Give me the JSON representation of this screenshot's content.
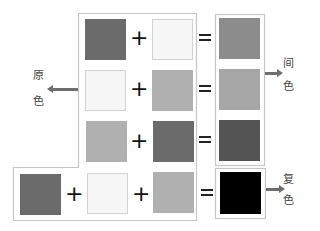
{
  "labels": {
    "primary": [
      "原",
      "色"
    ],
    "secondary": [
      "间",
      "色"
    ],
    "tertiary": [
      "复",
      "色"
    ]
  },
  "operators": {
    "plus": "+",
    "equals": "="
  },
  "colors": {
    "dark": "#6b6b6b",
    "white": "#f7f7f7",
    "mid": "#b0b0b0",
    "result_row1": "#8c8c8c",
    "result_row2": "#a6a6a6",
    "result_row3": "#545454",
    "result_bottom": "#000000",
    "frame": "#c6c6c6",
    "arrow": "#6e6e6e"
  },
  "rows": [
    {
      "inputs": [
        "dark",
        "white"
      ],
      "result": "result_row1",
      "group": "secondary"
    },
    {
      "inputs": [
        "white",
        "mid"
      ],
      "result": "result_row2",
      "group": "secondary"
    },
    {
      "inputs": [
        "mid",
        "dark"
      ],
      "result": "result_row3",
      "group": "secondary"
    },
    {
      "inputs": [
        "dark",
        "white",
        "mid"
      ],
      "result": "result_bottom",
      "group": "tertiary"
    }
  ]
}
